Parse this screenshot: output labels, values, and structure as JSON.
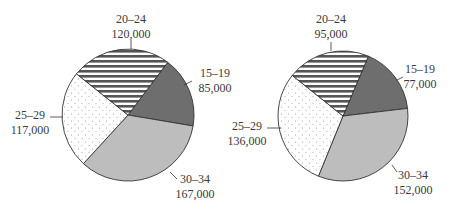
{
  "chart_data": [
    {
      "type": "pie",
      "title": "",
      "categories": [
        "20–24",
        "15–19",
        "30–34",
        "25–29"
      ],
      "values": [
        120000,
        85000,
        167000,
        117000
      ],
      "labels": [
        {
          "age": "20–24",
          "value": "120,000"
        },
        {
          "age": "15–19",
          "value": "85,000"
        },
        {
          "age": "30–34",
          "value": "167,000"
        },
        {
          "age": "25–29",
          "value": "117,000"
        }
      ],
      "start_angle_deg": 37
    },
    {
      "type": "pie",
      "title": "",
      "categories": [
        "20–24",
        "15–19",
        "30–34",
        "25–29"
      ],
      "values": [
        95000,
        77000,
        152000,
        136000
      ],
      "labels": [
        {
          "age": "20–24",
          "value": "95,000"
        },
        {
          "age": "15–19",
          "value": "77,000"
        },
        {
          "age": "30–34",
          "value": "152,000"
        },
        {
          "age": "25–29",
          "value": "136,000"
        }
      ],
      "start_angle_deg": 23
    }
  ],
  "patterns": {
    "20–24": "horizontal-stripes",
    "15–19": "dark-gray",
    "30–34": "light-gray",
    "25–29": "dotted"
  },
  "colors": {
    "dark": "#6e6e6e",
    "light": "#bdbdbd",
    "stroke": "#333333"
  }
}
